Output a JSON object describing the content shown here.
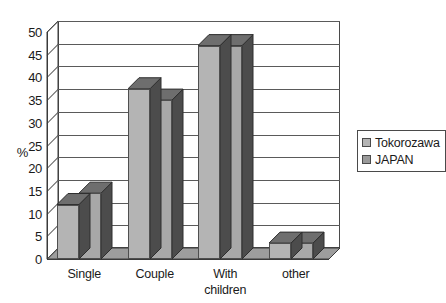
{
  "chart_data": {
    "type": "bar",
    "title": "",
    "subtitle": "",
    "xlabel": "",
    "ylabel": "%",
    "categories": [
      "Single",
      "Couple",
      "With\nchildren",
      "other"
    ],
    "series": [
      {
        "name": "Tokorozawa",
        "values": [
          12,
          37.5,
          47,
          3.5
        ],
        "color": "#b4b4b4"
      },
      {
        "name": "JAPAN",
        "values": [
          14.5,
          35,
          47,
          3.5
        ],
        "color": "#a8a8a8"
      }
    ],
    "ylim": [
      0,
      50
    ],
    "ytick_step": 5,
    "ytick_labels": [
      "0",
      "5",
      "10",
      "15",
      "20",
      "25",
      "30",
      "35",
      "40",
      "45",
      "50"
    ],
    "grid": true,
    "grid_axis": "y",
    "legend_position": "right",
    "style": "3d-column",
    "background": "#ffffff",
    "annotations": []
  },
  "legend": {
    "entries": [
      {
        "label": "Tokorozawa",
        "swatch": "#b4b4b4"
      },
      {
        "label": "JAPAN",
        "swatch": "#9a9a9a"
      }
    ]
  }
}
